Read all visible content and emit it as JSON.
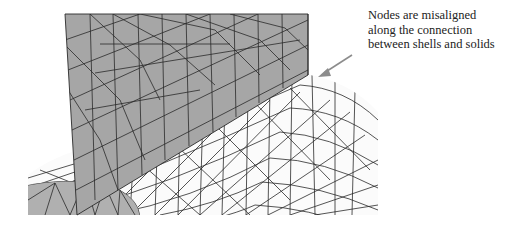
{
  "annotation": {
    "lines": [
      "Nodes are misaligned",
      "along the connection",
      "between shells and solids"
    ]
  },
  "colors": {
    "shell": "#a6a6a6",
    "solid": "#fbfbfb",
    "disk": "#b0b0b0",
    "edge": "#2a2a2a",
    "arrow": "#8c8c8c"
  },
  "labels": {
    "shell_region": "shell elements (gray plate)",
    "solid_region": "solid elements (white mesh)",
    "arrow": "pointer to misaligned nodes"
  }
}
